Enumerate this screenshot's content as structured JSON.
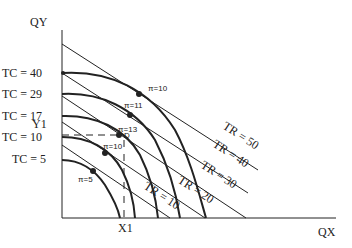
{
  "diagram": {
    "type": "isoprofit / revenue-cost tangency diagram",
    "axes": {
      "y_label": "QY",
      "x_label": "QX",
      "y_marker": "Y1",
      "x_marker": "X1"
    },
    "tc_curves": [
      {
        "label": "TC = 40",
        "y": 73
      },
      {
        "label": "TC = 29",
        "y": 94
      },
      {
        "label": "TC = 17",
        "y": 116
      },
      {
        "label": "TC = 10",
        "y": 137
      },
      {
        "label": "TC = 5",
        "y": 160
      }
    ],
    "tr_lines": [
      {
        "label": "TR = 50"
      },
      {
        "label": "TR = 40"
      },
      {
        "label": "TR = 30"
      },
      {
        "label": "TR = 20"
      },
      {
        "label": "TR = 10"
      }
    ],
    "profit_points": [
      {
        "label": "π=10"
      },
      {
        "label": "π=11"
      },
      {
        "label": "π=13"
      },
      {
        "label": "π=10"
      },
      {
        "label": "π=5"
      }
    ],
    "optimum_label": "D",
    "colors": {
      "ink": "#222222",
      "background": "#ffffff"
    }
  }
}
